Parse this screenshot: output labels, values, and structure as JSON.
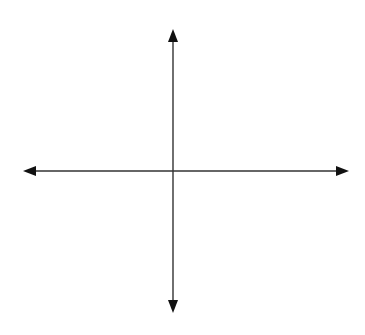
{
  "diagram": {
    "type": "coordinate-axes",
    "colors": {
      "background": "#ffffff",
      "axis": "#333333",
      "arrowhead": "#111111"
    },
    "origin": {
      "x": 173,
      "y": 171
    },
    "x_axis": {
      "x1": 23,
      "x2": 349,
      "y": 171
    },
    "y_axis": {
      "x": 173,
      "y1": 29,
      "y2": 313
    },
    "labels": []
  }
}
